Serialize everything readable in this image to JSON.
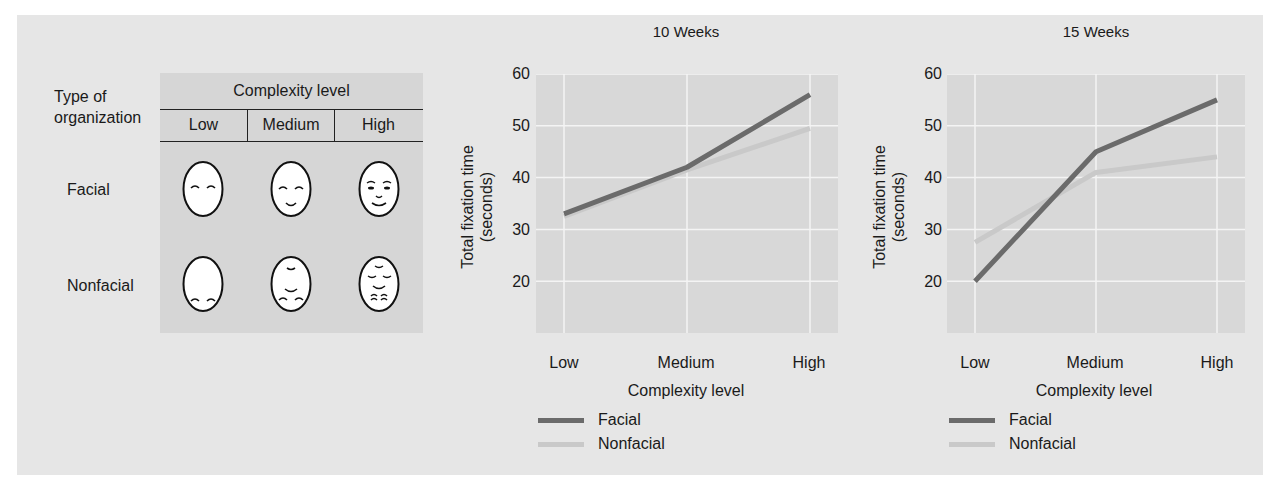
{
  "colors": {
    "panel_bg": "#e6e6e6",
    "plot_bg": "#d8d8d8",
    "grid": "#f4f4f4",
    "facial": "#6b6b6b",
    "nonfacial": "#c9c9c9"
  },
  "stimuli_table": {
    "row_header": "Type of\norganization",
    "row_header_line1": "Type of",
    "row_header_line2": "organization",
    "column_group": "Complexity level",
    "columns": [
      "Low",
      "Medium",
      "High"
    ],
    "rows": [
      {
        "label": "Facial",
        "faces": [
          "facial-low-face-icon",
          "facial-medium-face-icon",
          "facial-high-face-icon"
        ]
      },
      {
        "label": "Nonfacial",
        "faces": [
          "nonfacial-low-face-icon",
          "nonfacial-medium-face-icon",
          "nonfacial-high-face-icon"
        ]
      }
    ]
  },
  "chart_data": [
    {
      "type": "line",
      "title": "10 Weeks",
      "xlabel": "Complexity level",
      "ylabel": "Total fixation time\n(seconds)",
      "ylabel_line1": "Total fixation time",
      "ylabel_line2": "(seconds)",
      "categories": [
        "Low",
        "Medium",
        "High"
      ],
      "yticks": [
        20,
        30,
        40,
        50,
        60
      ],
      "ylim": [
        10,
        60
      ],
      "grid": true,
      "legend_position": "bottom",
      "series": [
        {
          "name": "Facial",
          "values": [
            33,
            42,
            56
          ]
        },
        {
          "name": "Nonfacial",
          "values": [
            32.5,
            41.5,
            49.5
          ]
        }
      ]
    },
    {
      "type": "line",
      "title": "15 Weeks",
      "xlabel": "Complexity level",
      "ylabel": "Total fixation time\n(seconds)",
      "ylabel_line1": "Total fixation time",
      "ylabel_line2": "(seconds)",
      "categories": [
        "Low",
        "Medium",
        "High"
      ],
      "yticks": [
        20,
        30,
        40,
        50,
        60
      ],
      "ylim": [
        10,
        60
      ],
      "grid": true,
      "legend_position": "bottom",
      "series": [
        {
          "name": "Facial",
          "values": [
            20,
            45,
            55
          ]
        },
        {
          "name": "Nonfacial",
          "values": [
            27.5,
            41,
            44
          ]
        }
      ]
    }
  ]
}
